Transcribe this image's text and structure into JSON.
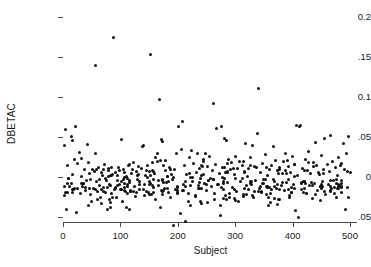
{
  "chart_data": {
    "type": "scatter",
    "title": "",
    "xlabel": "Subject",
    "ylabel": "DBETAC",
    "xlim": [
      0,
      510
    ],
    "ylim": [
      -0.065,
      0.205
    ],
    "grid": false,
    "legend": null,
    "marker": {
      "shape": "circle",
      "color": "#111111",
      "size": 3
    },
    "axis_color": "#4d4d4d",
    "background": "#ffffff",
    "xticks": [
      0,
      100,
      200,
      300,
      400,
      500
    ],
    "xtick_labels": [
      "0",
      "100",
      "200",
      "300",
      "400",
      "500"
    ],
    "yticks": [
      0.2,
      0.15,
      0.1,
      0.05,
      0,
      -0.05
    ],
    "ytick_labels": [
      "0.2",
      "0.15",
      "0.1",
      "0.05",
      "0",
      "-0.05"
    ],
    "n_points": 500,
    "notable_outliers": [
      {
        "x": 88,
        "y": 0.175
      },
      {
        "x": 152,
        "y": 0.153
      },
      {
        "x": 57,
        "y": 0.139
      },
      {
        "x": 340,
        "y": 0.111
      },
      {
        "x": 168,
        "y": 0.097
      },
      {
        "x": 262,
        "y": 0.092
      },
      {
        "x": 192,
        "y": -0.061
      },
      {
        "x": 215,
        "y": -0.055
      },
      {
        "x": 410,
        "y": -0.05
      },
      {
        "x": 275,
        "y": -0.048
      }
    ],
    "points": [
      [
        2,
        0.04
      ],
      [
        4,
        0.06
      ],
      [
        6,
        -0.04
      ],
      [
        8,
        0.014
      ],
      [
        10,
        -0.002
      ],
      [
        12,
        -0.012
      ],
      [
        14,
        0.051
      ],
      [
        16,
        0.046
      ],
      [
        18,
        -0.016
      ],
      [
        20,
        -0.014
      ],
      [
        22,
        0.063
      ],
      [
        24,
        -0.044
      ],
      [
        26,
        -0.014
      ],
      [
        28,
        0.031
      ],
      [
        30,
        -0.02
      ],
      [
        32,
        0.023
      ],
      [
        34,
        -0.012
      ],
      [
        36,
        -0.008
      ],
      [
        38,
        0.01
      ],
      [
        40,
        -0.017
      ],
      [
        42,
        0.041
      ],
      [
        44,
        -0.035
      ],
      [
        46,
        0.005
      ],
      [
        48,
        -0.022
      ],
      [
        50,
        -0.03
      ],
      [
        52,
        0.009
      ],
      [
        54,
        -0.014
      ],
      [
        56,
        0.03
      ],
      [
        57,
        0.139
      ],
      [
        58,
        -0.006
      ],
      [
        60,
        -0.018
      ],
      [
        62,
        0.012
      ],
      [
        64,
        -0.01
      ],
      [
        66,
        -0.025
      ],
      [
        68,
        0.002
      ],
      [
        70,
        -0.013
      ],
      [
        72,
        0.016
      ],
      [
        74,
        -0.019
      ],
      [
        76,
        -0.004
      ],
      [
        78,
        -0.04
      ],
      [
        80,
        0.008
      ],
      [
        82,
        -0.011
      ],
      [
        84,
        -0.021
      ],
      [
        86,
        0.003
      ],
      [
        88,
        0.175
      ],
      [
        90,
        -0.015
      ],
      [
        92,
        0.006
      ],
      [
        94,
        -0.026
      ],
      [
        96,
        0.012
      ],
      [
        98,
        -0.009
      ],
      [
        100,
        -0.016
      ],
      [
        102,
        0.047
      ],
      [
        104,
        -0.031
      ],
      [
        106,
        0.01
      ],
      [
        108,
        -0.013
      ],
      [
        110,
        0.001
      ],
      [
        112,
        -0.02
      ],
      [
        114,
        0.014
      ],
      [
        116,
        -0.007
      ],
      [
        118,
        -0.017
      ],
      [
        120,
        0.004
      ],
      [
        122,
        0.018
      ],
      [
        124,
        -0.012
      ],
      [
        126,
        -0.024
      ],
      [
        128,
        0.007
      ],
      [
        130,
        -0.003
      ],
      [
        132,
        0.013
      ],
      [
        134,
        -0.015
      ],
      [
        136,
        0.011
      ],
      [
        138,
        0.038
      ],
      [
        140,
        0.04
      ],
      [
        142,
        -0.009
      ],
      [
        144,
        0.002
      ],
      [
        146,
        -0.018
      ],
      [
        148,
        0.015
      ],
      [
        150,
        -0.006
      ],
      [
        152,
        0.153
      ],
      [
        154,
        -0.022
      ],
      [
        156,
        0.008
      ],
      [
        158,
        -0.013
      ],
      [
        160,
        0.005
      ],
      [
        162,
        -0.028
      ],
      [
        164,
        0.019
      ],
      [
        166,
        -0.01
      ],
      [
        168,
        0.097
      ],
      [
        170,
        -0.038
      ],
      [
        172,
        0.047
      ],
      [
        174,
        0.044
      ],
      [
        176,
        -0.014
      ],
      [
        178,
        0.021
      ],
      [
        180,
        -0.007
      ],
      [
        182,
        0.001
      ],
      [
        184,
        -0.019
      ],
      [
        186,
        0.012
      ],
      [
        188,
        -0.026
      ],
      [
        190,
        -0.003
      ],
      [
        192,
        -0.061
      ],
      [
        194,
        0.01
      ],
      [
        196,
        -0.016
      ],
      [
        198,
        0.029
      ],
      [
        200,
        -0.012
      ],
      [
        202,
        0.063
      ],
      [
        204,
        -0.046
      ],
      [
        206,
        0.035
      ],
      [
        208,
        0.069
      ],
      [
        210,
        -0.009
      ],
      [
        212,
        0.014
      ],
      [
        214,
        -0.055
      ],
      [
        216,
        0.003
      ],
      [
        218,
        -0.02
      ],
      [
        220,
        0.024
      ],
      [
        222,
        -0.011
      ],
      [
        224,
        0.033
      ],
      [
        226,
        -0.005
      ],
      [
        228,
        0.017
      ],
      [
        230,
        -0.023
      ],
      [
        232,
        0.006
      ],
      [
        234,
        0.029
      ],
      [
        236,
        -0.014
      ],
      [
        238,
        0.011
      ],
      [
        240,
        -0.031
      ],
      [
        242,
        0.002
      ],
      [
        244,
        0.02
      ],
      [
        246,
        -0.008
      ],
      [
        248,
        0.03
      ],
      [
        250,
        -0.017
      ],
      [
        252,
        0.013
      ],
      [
        254,
        -0.004
      ],
      [
        256,
        0.026
      ],
      [
        258,
        -0.012
      ],
      [
        260,
        0.008
      ],
      [
        262,
        0.092
      ],
      [
        264,
        -0.021
      ],
      [
        266,
        0.016
      ],
      [
        268,
        0.061
      ],
      [
        270,
        -0.009
      ],
      [
        272,
        0.005
      ],
      [
        274,
        -0.035
      ],
      [
        275,
        -0.048
      ],
      [
        276,
        0.063
      ],
      [
        278,
        0.012
      ],
      [
        280,
        -0.015
      ],
      [
        282,
        0.048
      ],
      [
        284,
        0.046
      ],
      [
        286,
        -0.007
      ],
      [
        288,
        0.022
      ],
      [
        290,
        -0.026
      ],
      [
        292,
        0.009
      ],
      [
        294,
        0.018
      ],
      [
        296,
        -0.013
      ],
      [
        298,
        0.003
      ],
      [
        300,
        0.026
      ],
      [
        302,
        -0.018
      ],
      [
        304,
        0.011
      ],
      [
        306,
        -0.03
      ],
      [
        308,
        0.02
      ],
      [
        310,
        -0.006
      ],
      [
        312,
        0.014
      ],
      [
        314,
        -0.022
      ],
      [
        316,
        0.007
      ],
      [
        318,
        0.042
      ],
      [
        320,
        -0.011
      ],
      [
        322,
        0.001
      ],
      [
        324,
        -0.016
      ],
      [
        326,
        0.024
      ],
      [
        328,
        -0.009
      ],
      [
        330,
        0.039
      ],
      [
        332,
        -0.025
      ],
      [
        334,
        0.013
      ],
      [
        336,
        -0.004
      ],
      [
        338,
        0.055
      ],
      [
        340,
        0.111
      ],
      [
        342,
        -0.014
      ],
      [
        344,
        0.006
      ],
      [
        346,
        -0.019
      ],
      [
        348,
        0.017
      ],
      [
        350,
        -0.008
      ],
      [
        352,
        0.028
      ],
      [
        354,
        -0.012
      ],
      [
        356,
        0.002
      ],
      [
        358,
        -0.036
      ],
      [
        360,
        0.01
      ],
      [
        362,
        -0.021
      ],
      [
        364,
        0.015
      ],
      [
        366,
        0.038
      ],
      [
        368,
        -0.005
      ],
      [
        370,
        0.021
      ],
      [
        372,
        -0.014
      ],
      [
        374,
        0.008
      ],
      [
        376,
        -0.028
      ],
      [
        378,
        0.012
      ],
      [
        380,
        -0.01
      ],
      [
        382,
        0.004
      ],
      [
        384,
        0.019
      ],
      [
        386,
        -0.017
      ],
      [
        388,
        0.03
      ],
      [
        390,
        -0.007
      ],
      [
        392,
        0.013
      ],
      [
        394,
        -0.023
      ],
      [
        396,
        0.006
      ],
      [
        398,
        -0.013
      ],
      [
        400,
        0.026
      ],
      [
        402,
        -0.009
      ],
      [
        404,
        0.016
      ],
      [
        406,
        0.065
      ],
      [
        408,
        0.002
      ],
      [
        410,
        -0.05
      ],
      [
        412,
        0.063
      ],
      [
        414,
        0.065
      ],
      [
        416,
        -0.015
      ],
      [
        418,
        0.011
      ],
      [
        420,
        -0.006
      ],
      [
        422,
        0.022
      ],
      [
        424,
        -0.02
      ],
      [
        426,
        0.008
      ],
      [
        428,
        0.032
      ],
      [
        430,
        -0.011
      ],
      [
        432,
        0.005
      ],
      [
        434,
        -0.027
      ],
      [
        436,
        0.018
      ],
      [
        438,
        -0.008
      ],
      [
        440,
        0.043
      ],
      [
        442,
        0.014
      ],
      [
        444,
        -0.017
      ],
      [
        446,
        0.003
      ],
      [
        448,
        -0.012
      ],
      [
        450,
        0.027
      ],
      [
        452,
        -0.005
      ],
      [
        454,
        0.01
      ],
      [
        456,
        0.048
      ],
      [
        458,
        -0.022
      ],
      [
        460,
        0.016
      ],
      [
        462,
        -0.009
      ],
      [
        464,
        0.007
      ],
      [
        466,
        0.052
      ],
      [
        468,
        -0.014
      ],
      [
        470,
        0.02
      ],
      [
        472,
        -0.004
      ],
      [
        474,
        0.012
      ],
      [
        476,
        -0.026
      ],
      [
        478,
        0.002
      ],
      [
        480,
        0.025
      ],
      [
        482,
        -0.011
      ],
      [
        484,
        0.015
      ],
      [
        486,
        -0.019
      ],
      [
        488,
        0.042
      ],
      [
        490,
        0.009
      ],
      [
        492,
        -0.04
      ],
      [
        494,
        0.03
      ],
      [
        496,
        -0.013
      ],
      [
        498,
        0.051
      ],
      [
        500,
        0.006
      ]
    ]
  }
}
